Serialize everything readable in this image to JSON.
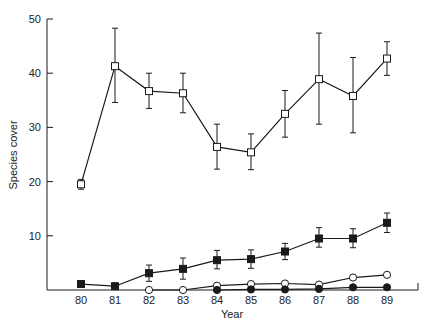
{
  "chart_data": {
    "type": "line",
    "title": "",
    "xlabel": "Year",
    "ylabel": "Species cover",
    "x": [
      80,
      81,
      82,
      83,
      84,
      85,
      86,
      87,
      88,
      89
    ],
    "xticks": [
      "80",
      "81",
      "82",
      "83",
      "84",
      "85",
      "86",
      "87",
      "88",
      "89"
    ],
    "yticks": [
      "10",
      "20",
      "30",
      "40",
      "50"
    ],
    "ylim": [
      0,
      50
    ],
    "grid": false,
    "legend": "none",
    "series": [
      {
        "name": "open-square",
        "marker": "square-open",
        "x": [
          80,
          81,
          82,
          83,
          84,
          85,
          86,
          87,
          88,
          89
        ],
        "values": [
          19.5,
          41.3,
          36.7,
          36.3,
          26.4,
          25.4,
          32.5,
          38.9,
          35.8,
          42.7
        ],
        "err_low": [
          18.6,
          34.6,
          33.5,
          32.7,
          22.3,
          22.2,
          28.2,
          30.6,
          29.0,
          39.6
        ],
        "err_high": [
          20.4,
          48.3,
          40.0,
          40.0,
          30.6,
          28.8,
          36.8,
          47.4,
          42.9,
          45.8
        ]
      },
      {
        "name": "filled-square",
        "marker": "square-filled",
        "x": [
          80,
          81,
          82,
          83,
          84,
          85,
          86,
          87,
          88,
          89
        ],
        "values": [
          1.1,
          0.7,
          3.1,
          3.9,
          5.5,
          5.7,
          7.1,
          9.5,
          9.5,
          12.4
        ],
        "err_low": [
          null,
          null,
          1.6,
          2.0,
          3.9,
          4.0,
          5.6,
          7.9,
          7.8,
          10.6
        ],
        "err_high": [
          null,
          null,
          4.6,
          5.9,
          7.3,
          7.4,
          8.6,
          11.5,
          11.3,
          14.2
        ]
      },
      {
        "name": "open-circle",
        "marker": "circle-open",
        "x": [
          82,
          83,
          84,
          85,
          86,
          87,
          88,
          89
        ],
        "values": [
          0.0,
          0.0,
          0.8,
          1.1,
          1.2,
          1.0,
          2.3,
          2.8
        ]
      },
      {
        "name": "filled-circle",
        "marker": "circle-filled",
        "x": [
          84,
          85,
          86,
          87,
          88,
          89
        ],
        "values": [
          0.0,
          0.1,
          0.1,
          0.2,
          0.5,
          0.5
        ]
      }
    ]
  },
  "colors": {
    "ink": "#1a1a1a",
    "background": "#ffffff"
  }
}
